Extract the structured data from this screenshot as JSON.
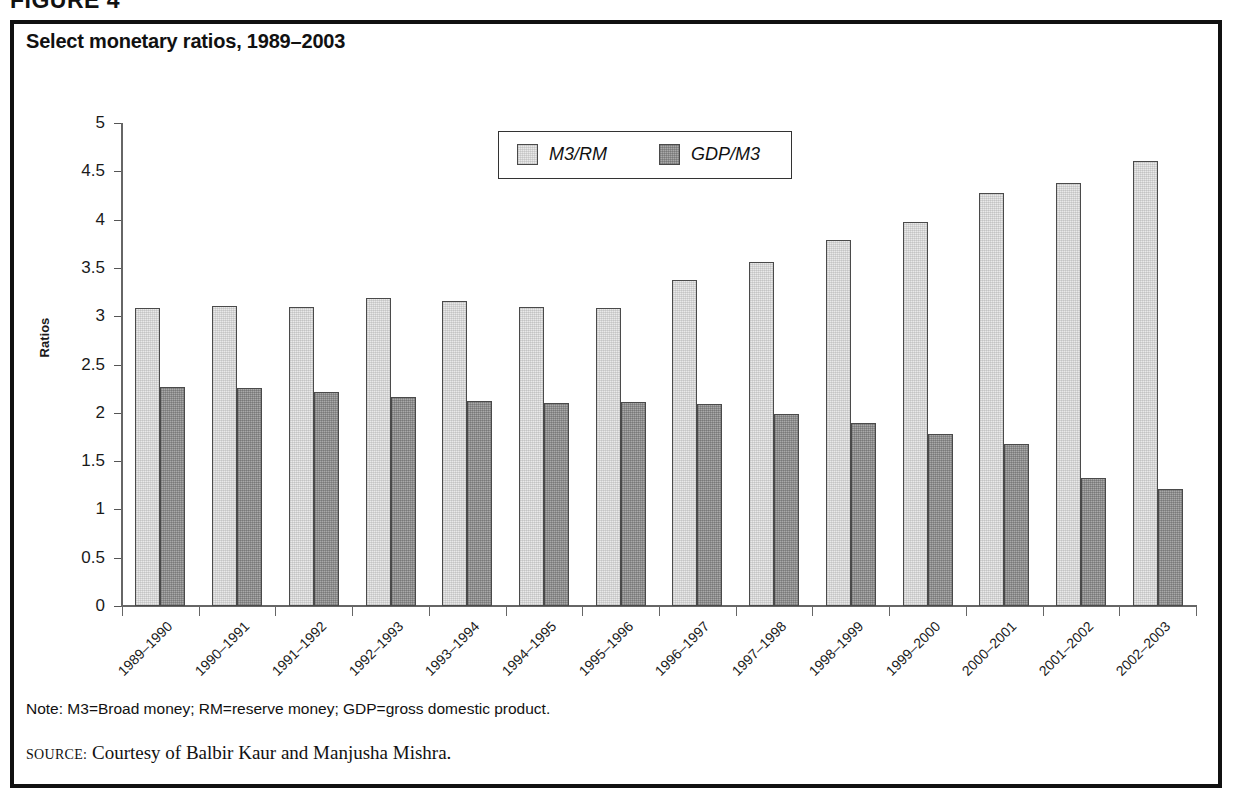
{
  "figure": {
    "label": "FIGURE 4",
    "title": "Select monetary ratios, 1989–2003"
  },
  "note": {
    "text": "Note: M3=Broad money; RM=reserve money; GDP=gross domestic product.",
    "source_kicker": "SOURCE:",
    "source_text": " Courtesy of Balbir Kaur and Manjusha Mishra."
  },
  "legend": {
    "position": "inside-top-center",
    "entries": [
      {
        "label": "M3/RM",
        "color": "#e9e9e9"
      },
      {
        "label": "GDP/M3",
        "color": "#a9a9a9"
      }
    ]
  },
  "axes": {
    "ylabel": "Ratios",
    "xlabel": "",
    "yticks": [
      "0",
      "0.5",
      "1",
      "1.5",
      "2",
      "2.5",
      "3",
      "3.5",
      "4",
      "4.5",
      "5"
    ]
  },
  "chart_data": {
    "type": "bar",
    "title": "Select monetary ratios, 1989–2003",
    "xlabel": "",
    "ylabel": "Ratios",
    "ylim": [
      0,
      5
    ],
    "ytick_step": 0.5,
    "grid": false,
    "legend_position": "upper center",
    "categories": [
      "1989–1990",
      "1990–1991",
      "1991–1992",
      "1992–1993",
      "1993–1994",
      "1994–1995",
      "1995–1996",
      "1996–1997",
      "1997–1998",
      "1998–1999",
      "1999–2000",
      "2000–2001",
      "2001–2002",
      "2002–2003"
    ],
    "series": [
      {
        "name": "M3/RM",
        "color": "#e9e9e9",
        "values": [
          3.08,
          3.11,
          3.1,
          3.19,
          3.16,
          3.1,
          3.08,
          3.37,
          3.56,
          3.79,
          3.97,
          4.28,
          4.38,
          4.61
        ]
      },
      {
        "name": "GDP/M3",
        "color": "#a9a9a9",
        "values": [
          2.27,
          2.26,
          2.22,
          2.16,
          2.12,
          2.1,
          2.11,
          2.09,
          1.99,
          1.89,
          1.78,
          1.68,
          1.33,
          1.21
        ]
      }
    ]
  }
}
